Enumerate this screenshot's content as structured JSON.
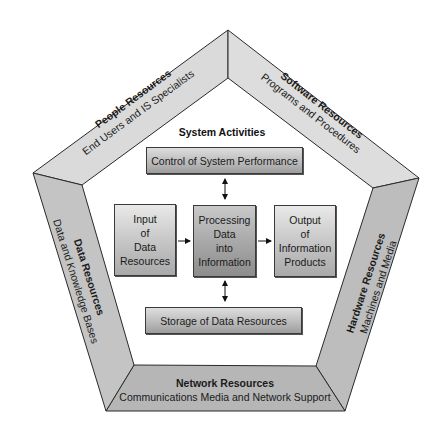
{
  "diagram": {
    "center_title": "System Activities",
    "resources": [
      {
        "id": "people",
        "title": "People Resources",
        "subtitle": "End Users and IS Specialists"
      },
      {
        "id": "software",
        "title": "Software Resources",
        "subtitle": "Programs and Procedures"
      },
      {
        "id": "hardware",
        "title": "Hardware Resources",
        "subtitle": "Machines and Media"
      },
      {
        "id": "network",
        "title": "Network Resources",
        "subtitle": "Communications Media and Network Support"
      },
      {
        "id": "data",
        "title": "Data Resources",
        "subtitle": "Data and Knowledge Bases"
      }
    ],
    "activities": {
      "control": "Control of System Performance",
      "input": "Input\nof\nData\nResources",
      "processing": "Processing\nData\ninto\nInformation",
      "output": "Output\nof\nInformation\nProducts",
      "storage": "Storage of Data Resources"
    },
    "colors": {
      "frame_light": "#dcdcdc",
      "frame_mid": "#c8c8c8",
      "frame_dark": "#b0b0b0",
      "outline": "#2a2a2a"
    }
  }
}
